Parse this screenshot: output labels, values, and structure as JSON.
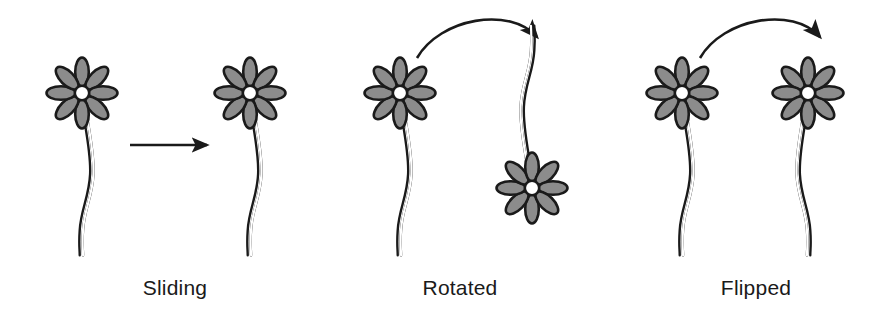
{
  "figure": {
    "background_color": "#ffffff",
    "width": 873,
    "height": 323
  },
  "style": {
    "petal_fill": "#8c8c8c",
    "petal_stroke": "#1a1a1a",
    "center_fill": "#ffffff",
    "stem_stroke": "#1a1a1a",
    "arrow_color": "#1a1a1a",
    "label_color": "#1a1a1a"
  },
  "panels": [
    {
      "id": "sliding",
      "label": "Sliding",
      "transformation": "translation",
      "arrow": "straight-right-arrow",
      "label_x": 175,
      "figures": [
        {
          "role": "original",
          "center_x": 82,
          "center_y": 93,
          "rotation": 0,
          "mirrored": false
        },
        {
          "role": "image",
          "center_x": 250,
          "center_y": 93,
          "rotation": 0,
          "mirrored": false
        }
      ]
    },
    {
      "id": "rotated",
      "label": "Rotated",
      "transformation": "rotation",
      "arrow": "curved-arc-arrow",
      "label_x": 460,
      "figures": [
        {
          "role": "original",
          "center_x": 400,
          "center_y": 93,
          "rotation": 0,
          "mirrored": false
        },
        {
          "role": "image",
          "center_x": 532,
          "center_y": 188,
          "rotation": 180,
          "mirrored": false
        }
      ]
    },
    {
      "id": "flipped",
      "label": "Flipped",
      "transformation": "reflection",
      "arrow": "curved-arc-arrow",
      "label_x": 756,
      "figures": [
        {
          "role": "original",
          "center_x": 682,
          "center_y": 93,
          "rotation": 0,
          "mirrored": false
        },
        {
          "role": "image",
          "center_x": 808,
          "center_y": 93,
          "rotation": 0,
          "mirrored": true
        }
      ]
    }
  ],
  "flower": {
    "petal_count": 8,
    "center_radius": 7,
    "petal_length": 30,
    "petal_width": 13,
    "description": "Eight gray outlined petals radiating from a small white circular center, with a long wavy double-outlined stem."
  },
  "labels": {
    "sliding": "Sliding",
    "rotated": "Rotated",
    "flipped": "Flipped"
  }
}
